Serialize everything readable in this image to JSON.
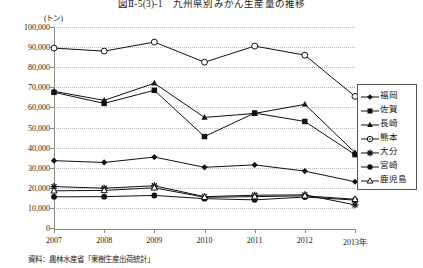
{
  "title": "図Ⅱ-5(3)-1　九州県別みかん生産量の推移",
  "unit_label": "(トン)",
  "source_note": "資料：農林水産省「果樹生産出荷統計」",
  "axis": {
    "y_ticks": [
      "0",
      "10,000",
      "20,000",
      "30,000",
      "40,000",
      "50,000",
      "60,000",
      "70,000",
      "80,000",
      "90,000",
      "100,000"
    ],
    "x_ticks": [
      "2007",
      "2008",
      "2009",
      "2010",
      "2011",
      "2012",
      "2013年"
    ]
  },
  "legend": {
    "items": [
      {
        "label": "福岡",
        "marker": "diamond-marker"
      },
      {
        "label": "佐賀",
        "marker": "square-marker"
      },
      {
        "label": "長崎",
        "marker": "triangle-marker"
      },
      {
        "label": "熊本",
        "marker": "circle-dot-marker"
      },
      {
        "label": "大分",
        "marker": "asterisk-marker"
      },
      {
        "label": "宮崎",
        "marker": "filled-circle-marker"
      },
      {
        "label": "鹿児島",
        "marker": "open-triangle-marker"
      }
    ]
  },
  "chart_data": {
    "type": "line",
    "title": "図Ⅱ-5(3)-1　九州県別みかん生産量の推移",
    "xlabel": "",
    "ylabel": "(トン)",
    "ylim": [
      0,
      100000
    ],
    "ytick_step": 10000,
    "grid": true,
    "legend_position": "right",
    "categories": [
      "2007",
      "2008",
      "2009",
      "2010",
      "2011",
      "2012",
      "2013"
    ],
    "series": [
      {
        "name": "福岡",
        "marker": "diamond",
        "values": [
          33500,
          32600,
          35300,
          30200,
          31400,
          28300,
          23000
        ]
      },
      {
        "name": "佐賀",
        "marker": "square",
        "values": [
          67500,
          62000,
          68500,
          45500,
          57200,
          53000,
          36500
        ]
      },
      {
        "name": "長崎",
        "marker": "triangle",
        "values": [
          68000,
          63500,
          72000,
          55000,
          57000,
          61500,
          37500
        ]
      },
      {
        "name": "熊本",
        "marker": "circle-open",
        "values": [
          89500,
          88000,
          92500,
          82500,
          90500,
          86000,
          65500
        ]
      },
      {
        "name": "大分",
        "marker": "asterisk",
        "values": [
          20600,
          19800,
          21000,
          15600,
          16300,
          16500,
          11500
        ]
      },
      {
        "name": "宮崎",
        "marker": "circle-filled",
        "values": [
          15500,
          15600,
          16200,
          14600,
          14000,
          15400,
          13900
        ]
      },
      {
        "name": "鹿児島",
        "marker": "triangle-open",
        "values": [
          18500,
          18700,
          20000,
          15300,
          15600,
          16000,
          14300
        ]
      }
    ]
  }
}
